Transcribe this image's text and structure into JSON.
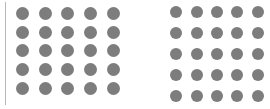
{
  "canvas": {
    "width": 270,
    "height": 109,
    "background_color": "#ffffff"
  },
  "divider": {
    "name": "vertical-rule",
    "color": "#b8b8b8",
    "x": 5,
    "y": 2,
    "width": 1.4,
    "height": 103
  },
  "groups": [
    {
      "id": "left-dot-grid",
      "label": "Left dot grid",
      "rows": 5,
      "columns": 5,
      "dot_count": 25,
      "dot_color": "#7d7d7d",
      "dot_diameter": 13,
      "column_pitch": 22.2,
      "row_pitch": 18.2,
      "x": 11,
      "y": 4,
      "width": 114,
      "height": 94
    },
    {
      "id": "right-dot-grid",
      "label": "Right dot grid",
      "rows": 5,
      "columns": 5,
      "dot_count": 25,
      "dot_color": "#7d7d7d",
      "dot_diameter": 12,
      "column_pitch": 19.6,
      "row_pitch": 19.6,
      "x": 166,
      "y": 2,
      "width": 102,
      "height": 104
    }
  ]
}
